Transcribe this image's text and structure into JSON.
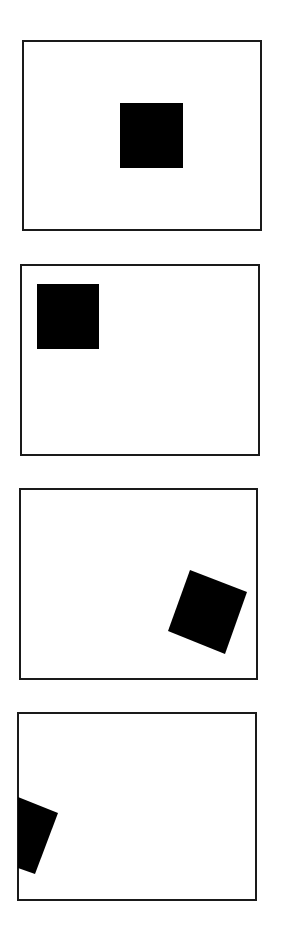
{
  "figure": {
    "width": 292,
    "height": 932,
    "background": "#ffffff",
    "frame_color": "#1a1a1a",
    "shape_color": "#000000",
    "panels": [
      {
        "id": "panel-1",
        "description": "square centered-right in frame, axis-aligned",
        "frame": {
          "x": 23,
          "y": 41,
          "w": 238,
          "h": 189
        },
        "shape_points": "120,103 183,103 183,168 120,168"
      },
      {
        "id": "panel-2",
        "description": "square at top-left of frame, axis-aligned",
        "frame": {
          "x": 21,
          "y": 265,
          "w": 238,
          "h": 190
        },
        "shape_points": "37,284 99,284 99,349 37,349"
      },
      {
        "id": "panel-3",
        "description": "square rotated, lower-right of frame",
        "frame": {
          "x": 20,
          "y": 489,
          "w": 237,
          "h": 190
        },
        "shape_points": "190,570 247,592 225,654 168,631"
      },
      {
        "id": "panel-4",
        "description": "rotated square clipped by left frame edge",
        "frame": {
          "x": 18,
          "y": 713,
          "w": 238,
          "h": 187
        },
        "shape_points": "18,797 58,813 35,874 18,868"
      }
    ]
  }
}
